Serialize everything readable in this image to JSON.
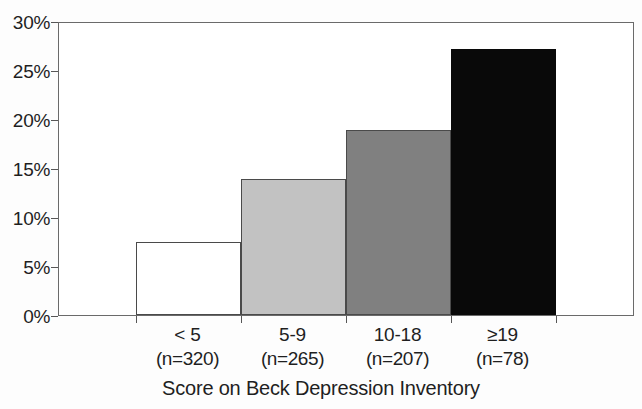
{
  "chart_data": {
    "type": "bar",
    "title": "",
    "xlabel": "Score on Beck Depression Inventory",
    "ylabel": "",
    "categories": [
      "< 5",
      "5-9",
      "10-18",
      "≥19"
    ],
    "group_sizes": [
      "(n=320)",
      "(n=265)",
      "(n=207)",
      "(n=78)"
    ],
    "values": [
      7.5,
      14.0,
      19.0,
      27.3
    ],
    "value_labels": [
      "7.5%",
      "14%",
      "19%",
      "27.3%"
    ],
    "ylim": [
      0,
      30
    ],
    "ytick_values": [
      0,
      5,
      10,
      15,
      20,
      25,
      30
    ],
    "ytick_labels": [
      "0%",
      "5%",
      "10%",
      "15%",
      "20%",
      "25%",
      "30%"
    ],
    "grid": false,
    "legend": "none",
    "bar_colors": [
      "#ffffff",
      "#c2c2c2",
      "#808080",
      "#090909"
    ],
    "bar_edge_color": "#4a4a4a",
    "axis_color": "#6a6a6a",
    "text_color": "#1f1f1f",
    "background": "#ffffff"
  }
}
